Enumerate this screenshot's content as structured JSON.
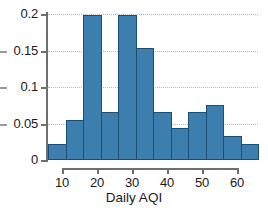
{
  "chart_data": {
    "type": "bar",
    "title": "",
    "subtitle": "",
    "xlabel": "Daily AQI",
    "ylabel": "",
    "xlim": [
      6,
      66
    ],
    "ylim": [
      0,
      0.2
    ],
    "grid": true,
    "legend": null,
    "legend_position": "none",
    "bin_width": 5,
    "bar_color": "#3c7fae",
    "bar_edge_color": "#1c4f72",
    "gridline_color": "#b9b9b9",
    "axis_color": "#6e6e6e",
    "xticks": [
      10,
      20,
      30,
      40,
      50,
      60
    ],
    "xtick_labels": [
      "10",
      "20",
      "30",
      "40",
      "50",
      "60"
    ],
    "yticks": [
      0,
      0.05,
      0.1,
      0.15,
      0.2
    ],
    "ytick_labels": [
      "0",
      "0.05",
      "0.1",
      "0.15",
      "0.2"
    ],
    "bins": [
      {
        "start": 6,
        "end": 11,
        "label": "6-11",
        "value": 0.022
      },
      {
        "start": 11,
        "end": 16,
        "label": "11-16",
        "value": 0.055
      },
      {
        "start": 16,
        "end": 21,
        "label": "16-21",
        "value": 0.198
      },
      {
        "start": 21,
        "end": 26,
        "label": "21-26",
        "value": 0.066
      },
      {
        "start": 26,
        "end": 31,
        "label": "26-31",
        "value": 0.198
      },
      {
        "start": 31,
        "end": 36,
        "label": "31-36",
        "value": 0.153
      },
      {
        "start": 36,
        "end": 41,
        "label": "36-41",
        "value": 0.066
      },
      {
        "start": 41,
        "end": 46,
        "label": "41-46",
        "value": 0.044
      },
      {
        "start": 46,
        "end": 51,
        "label": "46-51",
        "value": 0.066
      },
      {
        "start": 51,
        "end": 56,
        "label": "51-56",
        "value": 0.076
      },
      {
        "start": 56,
        "end": 61,
        "label": "56-61",
        "value": 0.033
      },
      {
        "start": 61,
        "end": 66,
        "label": "61-66",
        "value": 0.022
      }
    ],
    "categories": [
      "6-11",
      "11-16",
      "16-21",
      "21-26",
      "26-31",
      "31-36",
      "36-41",
      "41-46",
      "46-51",
      "51-56",
      "56-61",
      "61-66"
    ],
    "values": [
      0.022,
      0.055,
      0.198,
      0.066,
      0.198,
      0.153,
      0.066,
      0.044,
      0.066,
      0.076,
      0.033,
      0.022
    ]
  }
}
